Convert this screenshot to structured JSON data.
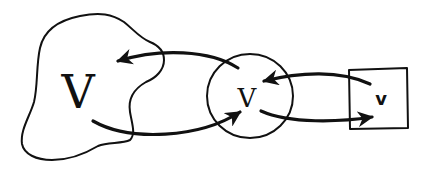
{
  "diagram": {
    "nodes": [
      {
        "id": "blob",
        "shape": "irregular-blob",
        "label": "V"
      },
      {
        "id": "circle",
        "shape": "circle",
        "label": "v"
      },
      {
        "id": "square",
        "shape": "square",
        "label": "v"
      }
    ],
    "edges": [
      {
        "from": "circle",
        "to": "blob"
      },
      {
        "from": "blob",
        "to": "circle"
      },
      {
        "from": "square",
        "to": "circle"
      },
      {
        "from": "circle",
        "to": "square"
      }
    ],
    "colors": {
      "ink": "#111111",
      "background": "#ffffff"
    }
  }
}
